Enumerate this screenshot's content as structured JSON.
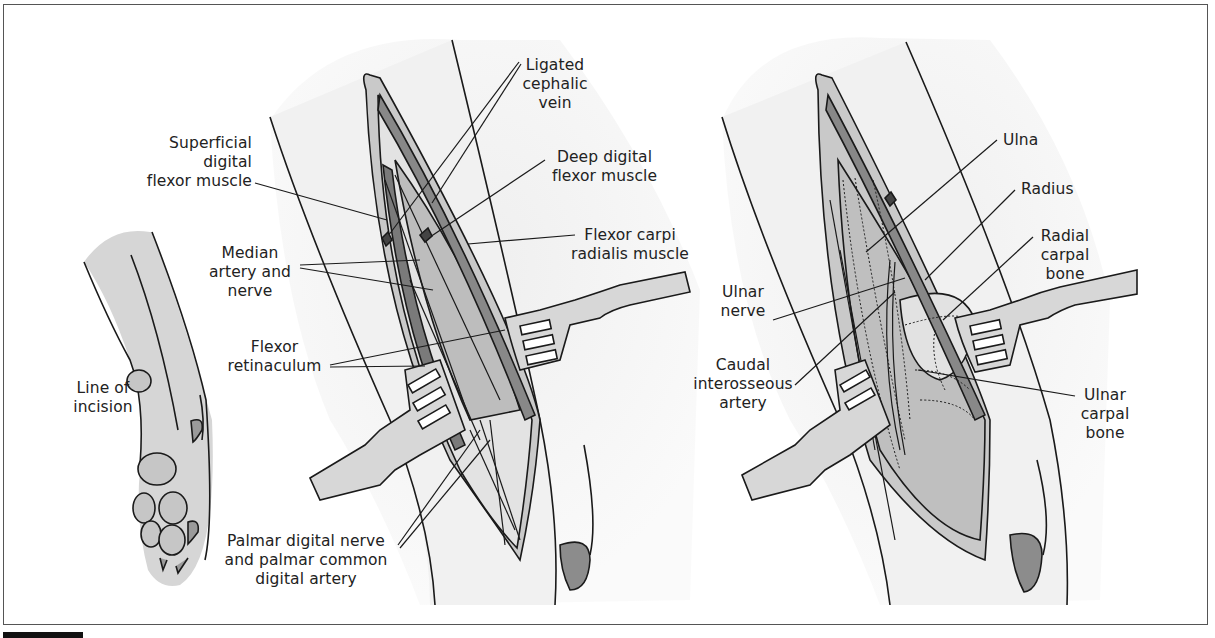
{
  "figure": {
    "panels": [
      {
        "id": "paw",
        "description": "Line of incision on forelimb"
      },
      {
        "id": "superficial-dissection",
        "description": "Superficial palmar approach"
      },
      {
        "id": "deep-dissection",
        "description": "Deep palmar approach exposing carpal bones"
      }
    ],
    "colors": {
      "outline": "#1a1a1a",
      "skin_fill": "#d9d9d9",
      "light_fill": "#ececec",
      "muscle_fill": "#bdbdbd",
      "dark_fill": "#7a7a7a",
      "pad_fill": "#c4c4c4",
      "bone_patch": "#8c8c8c"
    }
  },
  "labels": {
    "line_of_incision": "Line of\nincision",
    "superficial_digital_flexor": "Superficial\ndigital\nflexor muscle",
    "median_artery_nerve": "Median\nartery and\nnerve",
    "flexor_retinaculum": "Flexor\nretinaculum",
    "palmar_digital": "Palmar digital nerve\nand palmar common\ndigital artery",
    "ligated_cephalic_vein": "Ligated\ncephalic\nvein",
    "deep_digital_flexor": "Deep digital\nflexor muscle",
    "flexor_carpi_radialis": "Flexor carpi\nradialis muscle",
    "ulna": "Ulna",
    "radius": "Radius",
    "radial_carpal_bone": "Radial\ncarpal\nbone",
    "ulnar_nerve": "Ulnar\nnerve",
    "caudal_interosseous_artery": "Caudal\ninterosseous\nartery",
    "ulnar_carpal_bone": "Ulnar\ncarpal\nbone"
  }
}
